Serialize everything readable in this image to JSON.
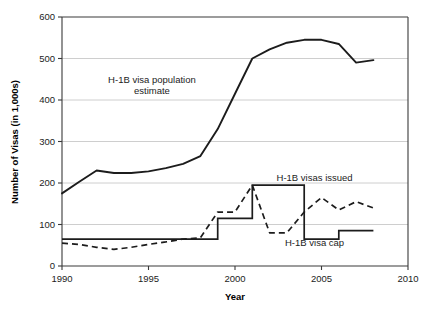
{
  "chart_data": {
    "type": "line",
    "title": "",
    "xlabel": "Year",
    "ylabel": "Number of Visas (in 1,000s)",
    "xlim": [
      1990,
      2010
    ],
    "ylim": [
      0,
      600
    ],
    "xticks": [
      1990,
      1995,
      2000,
      2005,
      2010
    ],
    "yticks": [
      0,
      100,
      200,
      300,
      400,
      500,
      600
    ],
    "grid": "horizontal",
    "legend_position": "inline-annotations",
    "series": [
      {
        "name": "H-1B visa population estimate",
        "style": "solid",
        "x": [
          1990,
          1991,
          1992,
          1993,
          1994,
          1995,
          1996,
          1997,
          1998,
          1999,
          2000,
          2001,
          2002,
          2003,
          2004,
          2005,
          2006,
          2007,
          2008
        ],
        "values": [
          175,
          203,
          230,
          224,
          224,
          228,
          236,
          246,
          265,
          330,
          415,
          500,
          522,
          538,
          545,
          545,
          535,
          490,
          496
        ]
      },
      {
        "name": "H-1B visa cap",
        "style": "solid",
        "x": [
          1990,
          1991,
          1992,
          1993,
          1994,
          1995,
          1996,
          1997,
          1998,
          1999,
          2000,
          2001,
          2002,
          2003,
          2004,
          2005,
          2006,
          2007,
          2008
        ],
        "values": [
          65,
          65,
          65,
          65,
          65,
          65,
          65,
          65,
          65,
          115,
          115,
          195,
          195,
          195,
          65,
          65,
          85,
          85,
          85
        ]
      },
      {
        "name": "H-1B visas issued",
        "style": "dashed",
        "x": [
          1990,
          1991,
          1992,
          1993,
          1994,
          1995,
          1996,
          1997,
          1998,
          1999,
          2000,
          2001,
          2002,
          2003,
          2004,
          2005,
          2006,
          2007,
          2008
        ],
        "values": [
          55,
          52,
          45,
          40,
          45,
          52,
          58,
          65,
          68,
          130,
          130,
          195,
          80,
          80,
          130,
          165,
          135,
          155,
          140
        ]
      }
    ],
    "annotations": [
      {
        "text_line1": "H-1B visa population",
        "text_line2": "estimate",
        "x": 1995.2,
        "y": 440
      },
      {
        "text_line1": "H-1B visas issued",
        "x": 2004.6,
        "y": 205
      },
      {
        "text_line1": "H-1B visa cap",
        "x": 2004.6,
        "y": 48
      }
    ]
  },
  "axes": {
    "x_title": "Year",
    "y_title": "Number of Visas (in 1,000s)",
    "x_tick_labels": [
      "1990",
      "1995",
      "2000",
      "2005",
      "2010"
    ],
    "y_tick_labels": [
      "0",
      "100",
      "200",
      "300",
      "400",
      "500",
      "600"
    ]
  },
  "colors": {
    "line": "#1c1c1c",
    "grid": "#c8c8c8",
    "axis": "#3a3a3a",
    "background": "#ffffff"
  }
}
